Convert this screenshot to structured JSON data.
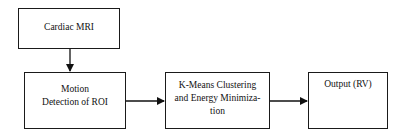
{
  "diagram": {
    "nodes": [
      {
        "id": "cardiac-mri",
        "lines": [
          "Cardiac MRI"
        ]
      },
      {
        "id": "motion-detection",
        "lines": [
          "Motion",
          "Detection of ROI"
        ]
      },
      {
        "id": "kmeans",
        "lines": [
          "K-Means Clustering",
          "and Energy Minimiza-",
          "tion"
        ]
      },
      {
        "id": "output",
        "lines": [
          "Output (RV)"
        ]
      }
    ],
    "edges": [
      {
        "from": "cardiac-mri",
        "to": "motion-detection"
      },
      {
        "from": "motion-detection",
        "to": "kmeans"
      },
      {
        "from": "kmeans",
        "to": "output"
      }
    ]
  }
}
